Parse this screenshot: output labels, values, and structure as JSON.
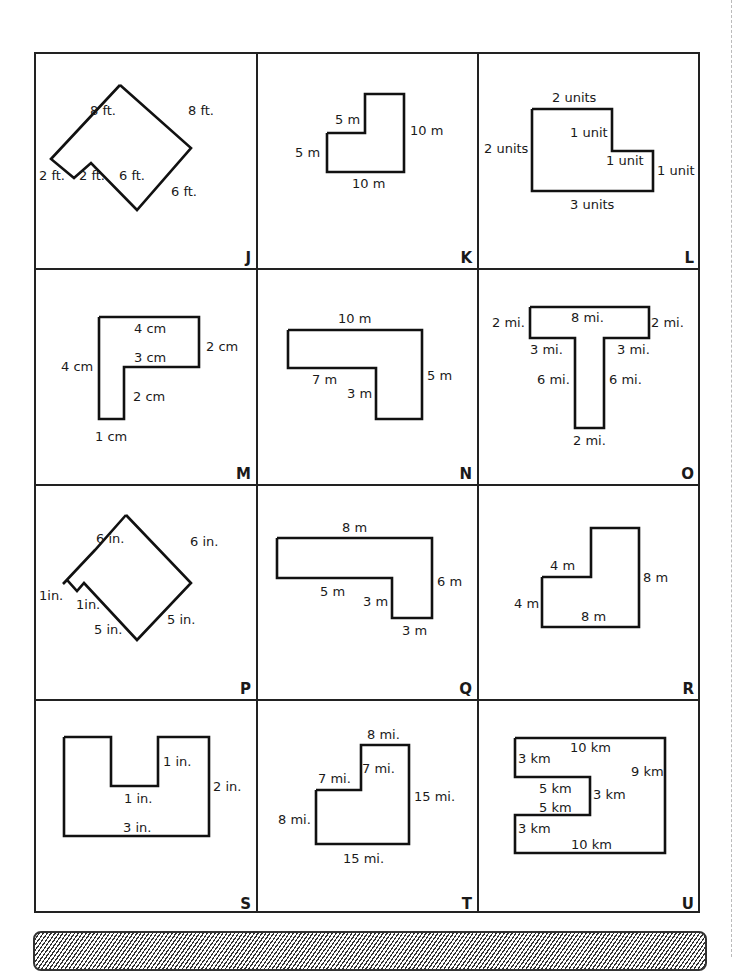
{
  "page": {
    "type": "worksheet"
  },
  "figures": [
    {
      "id": "J",
      "labels": [
        "8 ft.",
        "8 ft.",
        "2 ft.",
        "2 ft.",
        "6 ft.",
        "6 ft."
      ]
    },
    {
      "id": "K",
      "labels": [
        "5 m",
        "10 m",
        "5 m",
        "10 m"
      ]
    },
    {
      "id": "L",
      "labels": [
        "2 units",
        "1 unit",
        "2 units",
        "1 unit",
        "1 unit",
        "3 units"
      ]
    },
    {
      "id": "M",
      "labels": [
        "4 cm",
        "2 cm",
        "4 cm",
        "3 cm",
        "2 cm",
        "1 cm"
      ]
    },
    {
      "id": "N",
      "labels": [
        "10 m",
        "7 m",
        "3 m",
        "5 m"
      ]
    },
    {
      "id": "O",
      "labels": [
        "2 mi.",
        "8 mi.",
        "2 mi.",
        "3 mi.",
        "3 mi.",
        "6 mi.",
        "6 mi.",
        "2 mi."
      ]
    },
    {
      "id": "P",
      "labels": [
        "6 in.",
        "6 in.",
        "1in.",
        "1in.",
        "5 in.",
        "5 in."
      ]
    },
    {
      "id": "Q",
      "labels": [
        "8 m",
        "5 m",
        "3 m",
        "6 m",
        "3 m"
      ]
    },
    {
      "id": "R",
      "labels": [
        "4 m",
        "8 m",
        "4 m",
        "8 m"
      ]
    },
    {
      "id": "S",
      "labels": [
        "1 in.",
        "2 in.",
        "1 in.",
        "3 in."
      ]
    },
    {
      "id": "T",
      "labels": [
        "8 mi.",
        "7 mi.",
        "7 mi.",
        "15 mi.",
        "8 mi.",
        "15 mi."
      ]
    },
    {
      "id": "U",
      "labels": [
        "3 km",
        "10 km",
        "9 km",
        "5 km",
        "3 km",
        "5 km",
        "3 km",
        "10 km"
      ]
    }
  ],
  "footer": {
    "style": "hatched-bar"
  }
}
